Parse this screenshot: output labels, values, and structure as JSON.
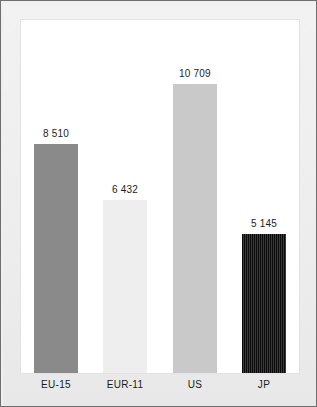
{
  "chart_data": {
    "type": "bar",
    "title": "",
    "subtitle": "",
    "xlabel": "",
    "ylabel": "",
    "categories": [
      "EU-15",
      "EUR-11",
      "US",
      "JP"
    ],
    "values": [
      8510,
      6432,
      10709,
      5145
    ],
    "value_labels": [
      "8 510",
      "6 432",
      "10 709",
      "5 145"
    ],
    "series": [
      {
        "name": "",
        "values": [
          8510,
          6432,
          10709,
          5145
        ]
      }
    ],
    "ylim": [
      0,
      13100
    ],
    "grid": false,
    "legend": "none",
    "axis_ticks": [],
    "bar_styles": [
      {
        "category": "EU-15",
        "fill": "solid",
        "color": "#8a8a8a"
      },
      {
        "category": "EUR-11",
        "fill": "solid",
        "color": "#eeeeee"
      },
      {
        "category": "US",
        "fill": "solid",
        "color": "#c9c9c9"
      },
      {
        "category": "JP",
        "fill": "vstripe",
        "color": "#111111"
      }
    ]
  },
  "figure": {
    "background_color": "#efefef",
    "plot_background_color": "#ffffff",
    "border_color": "#6e6e6e",
    "label_color": "#1a1a1a"
  }
}
